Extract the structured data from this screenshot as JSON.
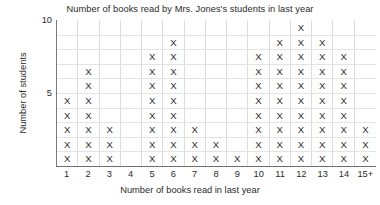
{
  "chart_data": {
    "type": "bar",
    "title": "Number of books read by Mrs. Jones's students in last year",
    "xlabel": "Number of books read in last year",
    "ylabel": "Number of students",
    "categories": [
      "1",
      "2",
      "3",
      "4",
      "5",
      "6",
      "7",
      "8",
      "9",
      "10",
      "11",
      "12",
      "13",
      "14",
      "15+"
    ],
    "values": [
      5,
      7,
      3,
      0,
      8,
      9,
      3,
      2,
      1,
      8,
      9,
      10,
      9,
      8,
      3
    ],
    "ylim": [
      0,
      10
    ],
    "ytick_labels": [
      "5",
      "10"
    ],
    "ytick_values": [
      5,
      10
    ],
    "grid": true,
    "legend": false,
    "marker": "X",
    "note": "Line plot / dot plot where each X mark represents one student"
  },
  "axis": {
    "y_tick_10": "10",
    "y_tick_5": "5"
  },
  "colors": {
    "mark": "#2e2e2e",
    "grid_line": "#dddddd",
    "axis_line": "#6e6e6e",
    "text": "#2b2b2b",
    "background": "#ffffff"
  }
}
